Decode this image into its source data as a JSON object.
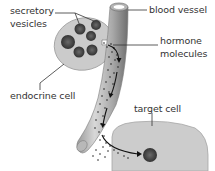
{
  "diagram": {
    "labels": {
      "secretory_vesicles_line1": "secretory",
      "secretory_vesicles_line2": "vesicles",
      "blood_vessel": "blood vessel",
      "hormone_molecules_line1": "hormone",
      "hormone_molecules_line2": "molecules",
      "endocrine_cell": "endocrine cell",
      "target_cell": "target cell"
    },
    "colors": {
      "cell_fill": "#c9c9c9",
      "cell_stroke": "#9a9a9a",
      "vesicle_fill": "#4a4a4a",
      "vessel_light": "#d4d4d4",
      "vessel_dark": "#7a7a7a",
      "hormone_dots": "#222222",
      "leader_lines": "#333333"
    }
  }
}
